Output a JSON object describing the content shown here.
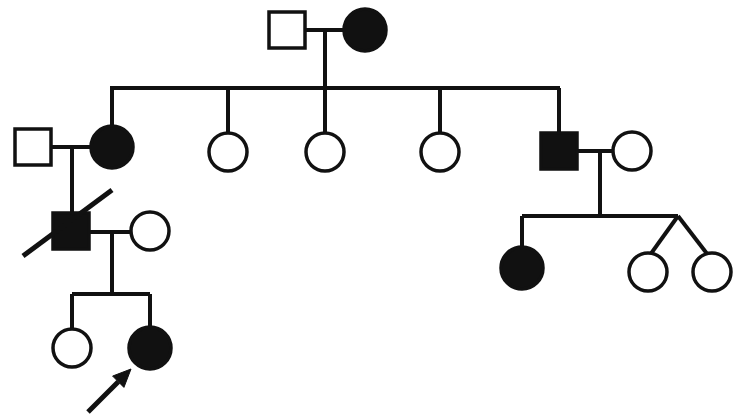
{
  "figure": {
    "title": "Family pedigree chart",
    "caption": "",
    "width": 744,
    "height": 420,
    "background_color": "#ffffff",
    "line_color": "#111111",
    "affected_fill": "#111111",
    "unaffected_fill": "#ffffff"
  },
  "legend": {
    "square_meaning": "male",
    "circle_meaning": "female",
    "filled_meaning": "affected",
    "open_meaning": "unaffected",
    "slash_meaning": "deceased",
    "arrow_meaning": "proband"
  },
  "chart_data": {
    "type": "diagram",
    "diagram_type": "pedigree",
    "generations": 4,
    "individual_count": 17,
    "individuals": [
      {
        "id": "I-1",
        "generation": 1,
        "sex": "male",
        "shape": "square",
        "affected": false,
        "deceased": false,
        "proband": false,
        "cx": 287,
        "cy": 30
      },
      {
        "id": "I-2",
        "generation": 1,
        "sex": "female",
        "shape": "circle",
        "affected": true,
        "deceased": false,
        "proband": false,
        "cx": 365,
        "cy": 30
      },
      {
        "id": "II-1",
        "generation": 2,
        "sex": "male",
        "shape": "square",
        "affected": false,
        "deceased": false,
        "proband": false,
        "cx": 33,
        "cy": 147
      },
      {
        "id": "II-2",
        "generation": 2,
        "sex": "female",
        "shape": "circle",
        "affected": true,
        "deceased": false,
        "proband": false,
        "cx": 112,
        "cy": 147
      },
      {
        "id": "II-3",
        "generation": 2,
        "sex": "female",
        "shape": "circle",
        "affected": false,
        "deceased": false,
        "proband": false,
        "cx": 228,
        "cy": 152
      },
      {
        "id": "II-4",
        "generation": 2,
        "sex": "female",
        "shape": "circle",
        "affected": false,
        "deceased": false,
        "proband": false,
        "cx": 325,
        "cy": 152
      },
      {
        "id": "II-5",
        "generation": 2,
        "sex": "female",
        "shape": "circle",
        "affected": false,
        "deceased": false,
        "proband": false,
        "cx": 440,
        "cy": 152
      },
      {
        "id": "II-6",
        "generation": 2,
        "sex": "male",
        "shape": "square",
        "affected": true,
        "deceased": false,
        "proband": false,
        "cx": 559,
        "cy": 151
      },
      {
        "id": "II-7",
        "generation": 2,
        "sex": "female",
        "shape": "circle",
        "affected": false,
        "deceased": false,
        "proband": false,
        "cx": 632,
        "cy": 151
      },
      {
        "id": "III-1",
        "generation": 3,
        "sex": "male",
        "shape": "square",
        "affected": true,
        "deceased": true,
        "proband": false,
        "cx": 71,
        "cy": 231
      },
      {
        "id": "III-2",
        "generation": 3,
        "sex": "female",
        "shape": "circle",
        "affected": false,
        "deceased": false,
        "proband": false,
        "cx": 150,
        "cy": 231
      },
      {
        "id": "III-3",
        "generation": 3,
        "sex": "female",
        "shape": "circle",
        "affected": true,
        "deceased": false,
        "proband": false,
        "cx": 522,
        "cy": 268
      },
      {
        "id": "III-4",
        "generation": 3,
        "sex": "female",
        "shape": "circle",
        "affected": false,
        "deceased": false,
        "proband": false,
        "cx": 648,
        "cy": 272,
        "twin": true
      },
      {
        "id": "III-5",
        "generation": 3,
        "sex": "female",
        "shape": "circle",
        "affected": false,
        "deceased": false,
        "proband": false,
        "cx": 712,
        "cy": 272,
        "twin": true
      },
      {
        "id": "IV-1",
        "generation": 4,
        "sex": "female",
        "shape": "circle",
        "affected": false,
        "deceased": false,
        "proband": false,
        "cx": 72,
        "cy": 348
      },
      {
        "id": "IV-2",
        "generation": 4,
        "sex": "female",
        "shape": "circle",
        "affected": true,
        "deceased": false,
        "proband": true,
        "cx": 150,
        "cy": 348
      }
    ],
    "matings": [
      {
        "partners": [
          "I-1",
          "I-2"
        ],
        "children": [
          "II-2",
          "II-3",
          "II-4",
          "II-5",
          "II-6"
        ]
      },
      {
        "partners": [
          "II-1",
          "II-2"
        ],
        "children": [
          "III-1"
        ]
      },
      {
        "partners": [
          "III-1",
          "III-2"
        ],
        "children": [
          "IV-1",
          "IV-2"
        ]
      },
      {
        "partners": [
          "II-6",
          "II-7"
        ],
        "children": [
          "III-3",
          "III-4",
          "III-5"
        ]
      }
    ],
    "twin_pairs": [
      [
        "III-4",
        "III-5"
      ]
    ],
    "affected_ids": [
      "I-2",
      "II-2",
      "II-6",
      "III-1",
      "III-3",
      "IV-2"
    ],
    "deceased_ids": [
      "III-1"
    ],
    "proband_id": "IV-2",
    "square_size": 36,
    "circle_radius": 19,
    "legend_note": "filled = affected, open = unaffected"
  },
  "annotations": {
    "proband_arrow": {
      "name": "proband-arrow",
      "from_x": 88,
      "from_y": 412,
      "to_x": 131,
      "to_y": 369,
      "points_to": "IV-2"
    },
    "deceased_slash": {
      "name": "deceased-slash",
      "from_x": 23,
      "from_y": 256,
      "to_x": 112,
      "to_y": 190,
      "applies_to": "III-1"
    }
  }
}
